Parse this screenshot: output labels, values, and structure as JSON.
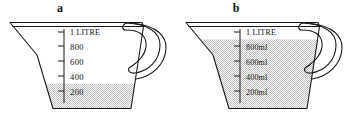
{
  "figure": {
    "background_color": "#ffffff",
    "ink_color": "#1a1a1a",
    "liquid_fill_color": "#d9d9d9"
  },
  "panels": [
    {
      "label": "a",
      "jug_name": "measuring-jug-a",
      "capacity_label": "1 LITRE",
      "scale_marks": [
        {
          "value": 1000,
          "label": "1 LITRE"
        },
        {
          "value": 800,
          "label": "800"
        },
        {
          "value": 600,
          "label": "600"
        },
        {
          "value": 400,
          "label": "400"
        },
        {
          "value": 200,
          "label": "200"
        }
      ],
      "fill_level_ml": 300,
      "units_shown_on_numbers": false
    },
    {
      "label": "b",
      "jug_name": "measuring-jug-b",
      "capacity_label": "1 LITRE",
      "scale_marks": [
        {
          "value": 1000,
          "label": "1 LITRE"
        },
        {
          "value": 800,
          "label": "800ml"
        },
        {
          "value": 600,
          "label": "600ml"
        },
        {
          "value": 400,
          "label": "400ml"
        },
        {
          "value": 200,
          "label": "200ml"
        }
      ],
      "fill_level_ml": 900,
      "units_shown_on_numbers": true
    }
  ],
  "chart_data": {
    "type": "bar",
    "categories": [
      "a",
      "b"
    ],
    "values": [
      300,
      900
    ],
    "xlabel": "Jug",
    "ylabel": "Volume (ml)",
    "ylim": [
      0,
      1000
    ],
    "tick_labels": [
      "200",
      "400",
      "600",
      "800",
      "1 LITRE"
    ],
    "tick_values": [
      200,
      400,
      600,
      800,
      1000
    ],
    "grid": false,
    "legend": "none"
  }
}
